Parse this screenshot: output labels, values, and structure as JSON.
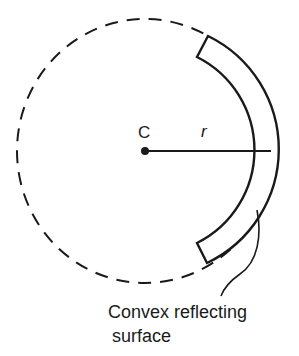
{
  "diagram": {
    "center_label": "C",
    "radius_label": "r",
    "caption_line1": "Convex reflecting",
    "caption_line2": "surface",
    "colors": {
      "stroke": "#1a1a1a",
      "background": "#ffffff"
    },
    "elements": [
      {
        "type": "dashed-circle",
        "center": [
          145,
          151
        ],
        "rx": 128,
        "ry": 132
      },
      {
        "type": "center-point",
        "label": "C",
        "position": [
          145,
          151
        ]
      },
      {
        "type": "radius-line",
        "label": "r",
        "from": [
          145,
          151
        ],
        "to": [
          271,
          151
        ]
      },
      {
        "type": "mirror-arc",
        "inner_radius": 104,
        "outer_radius": 126
      },
      {
        "type": "leader-line",
        "target": "mirror-arc",
        "label": "Convex reflecting surface"
      }
    ]
  }
}
